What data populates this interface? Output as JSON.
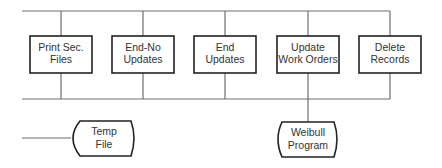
{
  "diagram": {
    "processes": [
      {
        "id": "print-sec-files",
        "lines": [
          "Print Sec.",
          "Files"
        ]
      },
      {
        "id": "end-no-updates",
        "lines": [
          "End-No",
          "Updates"
        ]
      },
      {
        "id": "end-updates",
        "lines": [
          "End",
          "Updates"
        ]
      },
      {
        "id": "update-work-orders",
        "lines": [
          "Update",
          "Work Orders"
        ]
      },
      {
        "id": "delete-records",
        "lines": [
          "Delete",
          "Records"
        ]
      }
    ],
    "storage": [
      {
        "id": "temp-file",
        "lines": [
          "Temp",
          "File"
        ]
      },
      {
        "id": "weibull-program",
        "lines": [
          "Weibull",
          "Program"
        ]
      }
    ]
  }
}
